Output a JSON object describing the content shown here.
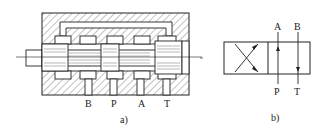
{
  "figure": {
    "panel_a": {
      "caption": "a)",
      "description": "Sectional view of 4-way spool directional valve",
      "ports": [
        "B",
        "P",
        "A",
        "T"
      ]
    },
    "panel_b": {
      "caption": "b)",
      "description": "Graphic symbol of two-position four-way directional valve",
      "ports_top": [
        "A",
        "B"
      ],
      "ports_bottom": [
        "P",
        "T"
      ]
    }
  },
  "colors": {
    "line": "#222222",
    "hatch": "#555555",
    "background": "#ffffff"
  }
}
